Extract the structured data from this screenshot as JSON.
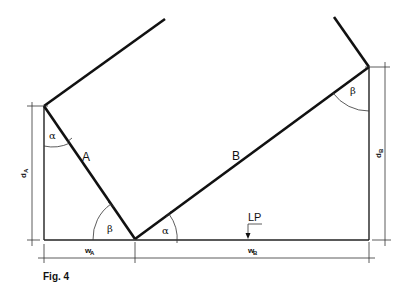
{
  "figure": {
    "caption": "Fig. 4",
    "labels": {
      "panel_a": "A",
      "panel_b": "B",
      "alpha": "α",
      "beta": "β",
      "lp": "LP"
    },
    "dimensions": {
      "d_a": {
        "base": "d",
        "sub": "A"
      },
      "d_b": {
        "base": "d",
        "sub": "B"
      },
      "w_a": {
        "base": "w",
        "sub": "A"
      },
      "w_b": {
        "base": "w",
        "sub": "B"
      }
    },
    "colors": {
      "line": "#111111",
      "background": "#ffffff"
    }
  }
}
